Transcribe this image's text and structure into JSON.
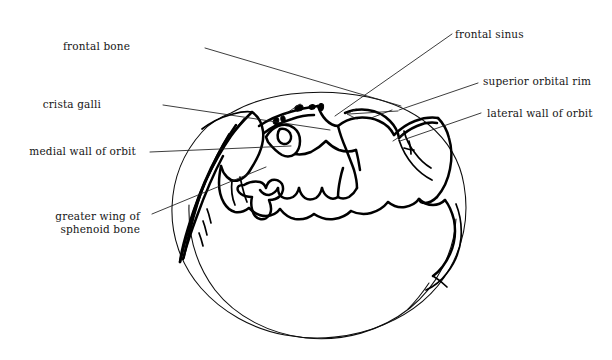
{
  "figure": {
    "kind": "anatomical-line-drawing",
    "background_color": "#ffffff",
    "line_color": "#000000",
    "text_color": "#161616"
  },
  "labels": [
    {
      "id": "frontal-bone",
      "text": "frontal bone",
      "align": "right",
      "x": 128,
      "y": 40,
      "leader": "M 201 47 L 214 49 L 222 56"
    },
    {
      "id": "frontal-sinus",
      "text": "frontal sinus",
      "align": "left",
      "x": 455,
      "y": 28,
      "leader": "M 450 37 L 437 39 L 428 46"
    },
    {
      "id": "crista-galli",
      "text": "crista galli",
      "align": "right",
      "x": 99,
      "y": 98,
      "leader": "M 160 105 L 176 105"
    },
    {
      "id": "superior-orbital-rim",
      "text": "superior orbital rim",
      "align": "left",
      "x": 483,
      "y": 75,
      "leader": "M 477 84 L 466 85"
    },
    {
      "id": "lateral-wall-of-orbit",
      "text": "lateral wall of orbit",
      "align": "left",
      "x": 487,
      "y": 107,
      "leader": "M 480 114 L 468 115"
    },
    {
      "id": "medial-wall-of-orbit",
      "text": "medial wall of orbit",
      "align": "right",
      "x": 33,
      "y": 145,
      "leader": "M 146 152 L 176 152"
    },
    {
      "id": "greater-wing-of-sphenoid-bone",
      "text": "greater wing of\nsphenoid bone",
      "align": "right",
      "x": 54,
      "y": 210,
      "leader": "M 149 215 L 172 211"
    }
  ],
  "leader_lines": [
    {
      "id": "leader-frontal-bone",
      "from_label": "frontal-bone",
      "path": "M 205 48 L 401 106"
    },
    {
      "id": "leader-frontal-sinus",
      "from_label": "frontal-sinus",
      "path": "M 452 34 L 335 116"
    },
    {
      "id": "leader-crista-galli",
      "from_label": "crista-galli",
      "path": "M 163 105 L 330 130"
    },
    {
      "id": "leader-superior-orbital-rim",
      "from_label": "superior-orbital-rim",
      "path": "M 478 83 L 399 110"
    },
    {
      "id": "leader-lateral-wall-of-orbit",
      "from_label": "lateral-wall-of-orbit",
      "path": "M 481 113 L 400 141"
    },
    {
      "id": "leader-medial-wall-of-orbit",
      "from_label": "medial-wall-of-orbit",
      "path": "M 150 152 L 291 146"
    },
    {
      "id": "leader-greater-wing",
      "from_label": "greater-wing-of-sphenoid-bone",
      "path": "M 152 214 L 266 167"
    },
    {
      "id": "leader-internal-frontal-sinus",
      "from_label": "frontal-sinus",
      "path": "M 300 104 L 281 117"
    },
    {
      "id": "leader-internal-orbital-rim",
      "from_label": "superior-orbital-rim",
      "path": "M 392 110 L 371 118"
    },
    {
      "id": "leader-internal-lateral-wall",
      "from_label": "lateral-wall-of-orbit",
      "path": "M 404 134 L 393 141"
    }
  ],
  "arrows": [
    {
      "id": "arrow-superior-orbital-rim",
      "path": "M 398 111 L 349 114 M 355 110 L 348 114 L 356 118"
    }
  ]
}
